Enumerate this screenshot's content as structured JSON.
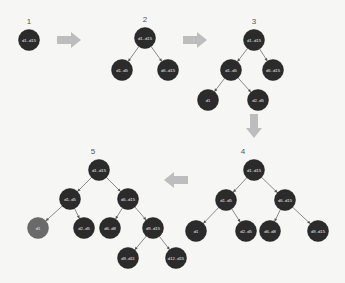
{
  "diagram": {
    "colors": {
      "background": "#f6f6f4",
      "node": "#2b2b2b",
      "node_highlight": "#6a6a6a",
      "edge": "#8a8a8a",
      "arrow": "#bdbdbd",
      "node_text": "#e8e8e8"
    },
    "steps": [
      {
        "label": "1",
        "label_pos": [
          29,
          24
        ],
        "nodes": [
          {
            "id": "s1n0",
            "text": "d1..d15",
            "x": 29,
            "y": 40
          }
        ],
        "edges": []
      },
      {
        "label": "2",
        "label_pos": [
          145,
          22
        ],
        "nodes": [
          {
            "id": "s2n0",
            "text": "d1..d15",
            "x": 145,
            "y": 38
          },
          {
            "id": "s2n1",
            "text": "d1..d5",
            "x": 122,
            "y": 70
          },
          {
            "id": "s2n2",
            "text": "d6..d15",
            "x": 168,
            "y": 70
          }
        ],
        "edges": [
          [
            "s2n0",
            "s2n1"
          ],
          [
            "s2n0",
            "s2n2"
          ]
        ]
      },
      {
        "label": "3",
        "label_pos": [
          254,
          24
        ],
        "nodes": [
          {
            "id": "s3n0",
            "text": "d1..d15",
            "x": 254,
            "y": 40
          },
          {
            "id": "s3n1",
            "text": "d1..d5",
            "x": 231,
            "y": 70
          },
          {
            "id": "s3n2",
            "text": "d6..d15",
            "x": 273,
            "y": 70
          },
          {
            "id": "s3n3",
            "text": "d1",
            "x": 208,
            "y": 100
          },
          {
            "id": "s3n4",
            "text": "d2..d5",
            "x": 258,
            "y": 100
          }
        ],
        "edges": [
          [
            "s3n0",
            "s3n1"
          ],
          [
            "s3n0",
            "s3n2"
          ],
          [
            "s3n1",
            "s3n3"
          ],
          [
            "s3n1",
            "s3n4"
          ]
        ]
      },
      {
        "label": "4",
        "label_pos": [
          243,
          154
        ],
        "nodes": [
          {
            "id": "s4n0",
            "text": "d1..d15",
            "x": 254,
            "y": 170
          },
          {
            "id": "s4n1",
            "text": "d1..d5",
            "x": 226,
            "y": 200
          },
          {
            "id": "s4n2",
            "text": "d6..d15",
            "x": 285,
            "y": 200
          },
          {
            "id": "s4n3",
            "text": "d1",
            "x": 196,
            "y": 231
          },
          {
            "id": "s4n4",
            "text": "d2..d5",
            "x": 246,
            "y": 231
          },
          {
            "id": "s4n5",
            "text": "d6..d8",
            "x": 270,
            "y": 231
          },
          {
            "id": "s4n6",
            "text": "d9..d15",
            "x": 318,
            "y": 231
          }
        ],
        "edges": [
          [
            "s4n0",
            "s4n1"
          ],
          [
            "s4n0",
            "s4n2"
          ],
          [
            "s4n1",
            "s4n3"
          ],
          [
            "s4n1",
            "s4n4"
          ],
          [
            "s4n2",
            "s4n5"
          ],
          [
            "s4n2",
            "s4n6"
          ]
        ]
      },
      {
        "label": "5",
        "label_pos": [
          93,
          154
        ],
        "nodes": [
          {
            "id": "s5n0",
            "text": "d1..d15",
            "x": 99,
            "y": 170
          },
          {
            "id": "s5n1",
            "text": "d1..d5",
            "x": 70,
            "y": 199
          },
          {
            "id": "s5n2",
            "text": "d6..d15",
            "x": 128,
            "y": 199
          },
          {
            "id": "s5n3",
            "text": "d1",
            "x": 38,
            "y": 228,
            "highlight": true
          },
          {
            "id": "s5n4",
            "text": "d2..d5",
            "x": 84,
            "y": 228
          },
          {
            "id": "s5n5",
            "text": "d6..d8",
            "x": 110,
            "y": 228
          },
          {
            "id": "s5n6",
            "text": "d9..d15",
            "x": 153,
            "y": 228
          },
          {
            "id": "s5n7",
            "text": "d9..d11",
            "x": 128,
            "y": 258
          },
          {
            "id": "s5n8",
            "text": "d12..d15",
            "x": 176,
            "y": 258
          }
        ],
        "edges": [
          [
            "s5n0",
            "s5n1"
          ],
          [
            "s5n0",
            "s5n2"
          ],
          [
            "s5n1",
            "s5n3"
          ],
          [
            "s5n1",
            "s5n4"
          ],
          [
            "s5n2",
            "s5n5"
          ],
          [
            "s5n2",
            "s5n6"
          ],
          [
            "s5n6",
            "s5n7"
          ],
          [
            "s5n6",
            "s5n8"
          ]
        ]
      }
    ],
    "arrows": [
      {
        "name": "arrow-step1-to-2",
        "dir": "right",
        "x": 57,
        "y": 40
      },
      {
        "name": "arrow-step2-to-3",
        "dir": "right",
        "x": 183,
        "y": 40
      },
      {
        "name": "arrow-step3-to-4",
        "dir": "down",
        "x": 254,
        "y": 126
      },
      {
        "name": "arrow-step4-to-5",
        "dir": "left",
        "x": 164,
        "y": 180
      }
    ],
    "node_radius": 10.5
  }
}
